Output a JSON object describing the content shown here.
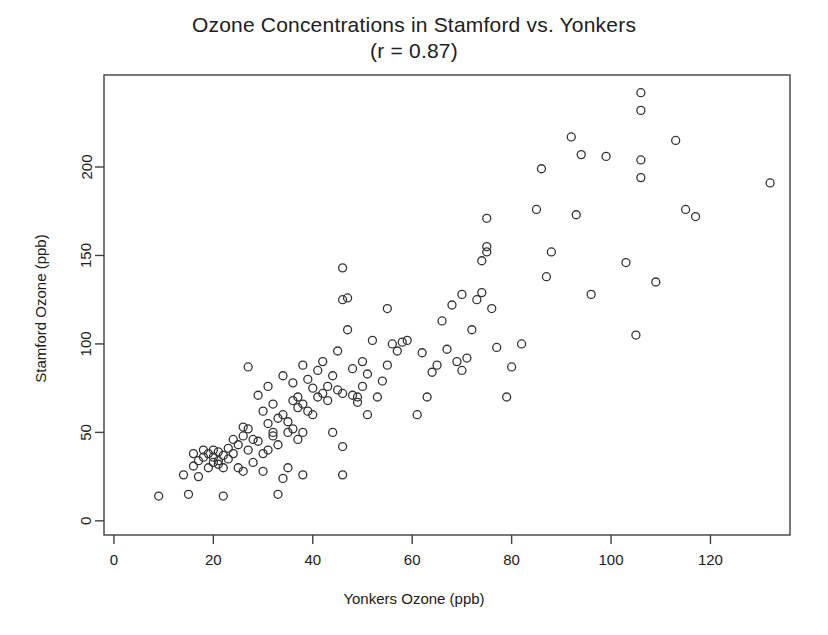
{
  "chart_data": {
    "type": "scatter",
    "title": "Ozone Concentrations in Stamford vs. Yonkers",
    "subtitle": "(r = 0.87)",
    "correlation": 0.87,
    "xlabel": "Yonkers Ozone (ppb)",
    "ylabel": "Stamford Ozone (ppb)",
    "xlim": [
      -2,
      136
    ],
    "ylim": [
      -8,
      252
    ],
    "xticks": [
      0,
      20,
      40,
      60,
      80,
      100,
      120
    ],
    "yticks": [
      0,
      50,
      100,
      150,
      200
    ],
    "xtick_labels": [
      "0",
      "20",
      "40",
      "60",
      "80",
      "100",
      "120"
    ],
    "ytick_labels": [
      "0",
      "50",
      "100",
      "150",
      "200"
    ],
    "grid": false,
    "legend": false,
    "marker": "open-circle",
    "marker_color": "#333333",
    "marker_size": 8,
    "background": "#ffffff",
    "axis_color": "#404040",
    "n_points": 136,
    "series": [
      {
        "name": "Stamford vs Yonkers daily ozone",
        "points": [
          [
            9,
            14
          ],
          [
            14,
            26
          ],
          [
            15,
            15
          ],
          [
            16,
            31
          ],
          [
            16,
            38
          ],
          [
            17,
            34
          ],
          [
            17,
            25
          ],
          [
            18,
            36
          ],
          [
            18,
            40
          ],
          [
            19,
            30
          ],
          [
            19,
            38
          ],
          [
            20,
            33
          ],
          [
            20,
            36
          ],
          [
            20,
            40
          ],
          [
            21,
            32
          ],
          [
            21,
            34
          ],
          [
            21,
            39
          ],
          [
            22,
            14
          ],
          [
            22,
            30
          ],
          [
            22,
            37
          ],
          [
            23,
            35
          ],
          [
            23,
            41
          ],
          [
            24,
            38
          ],
          [
            24,
            46
          ],
          [
            25,
            30
          ],
          [
            25,
            43
          ],
          [
            26,
            28
          ],
          [
            26,
            48
          ],
          [
            26,
            53
          ],
          [
            27,
            40
          ],
          [
            27,
            52
          ],
          [
            27,
            87
          ],
          [
            28,
            33
          ],
          [
            28,
            46
          ],
          [
            29,
            45
          ],
          [
            29,
            71
          ],
          [
            30,
            28
          ],
          [
            30,
            38
          ],
          [
            30,
            62
          ],
          [
            31,
            40
          ],
          [
            31,
            55
          ],
          [
            31,
            76
          ],
          [
            32,
            48
          ],
          [
            32,
            50
          ],
          [
            32,
            66
          ],
          [
            33,
            15
          ],
          [
            33,
            43
          ],
          [
            33,
            58
          ],
          [
            34,
            24
          ],
          [
            34,
            60
          ],
          [
            34,
            82
          ],
          [
            35,
            30
          ],
          [
            35,
            50
          ],
          [
            35,
            56
          ],
          [
            36,
            52
          ],
          [
            36,
            68
          ],
          [
            36,
            78
          ],
          [
            37,
            46
          ],
          [
            37,
            64
          ],
          [
            37,
            70
          ],
          [
            38,
            26
          ],
          [
            38,
            50
          ],
          [
            38,
            66
          ],
          [
            38,
            88
          ],
          [
            39,
            62
          ],
          [
            39,
            80
          ],
          [
            40,
            60
          ],
          [
            40,
            75
          ],
          [
            41,
            70
          ],
          [
            41,
            85
          ],
          [
            42,
            72
          ],
          [
            42,
            90
          ],
          [
            43,
            68
          ],
          [
            43,
            76
          ],
          [
            44,
            50
          ],
          [
            44,
            82
          ],
          [
            45,
            74
          ],
          [
            45,
            96
          ],
          [
            46,
            26
          ],
          [
            46,
            42
          ],
          [
            46,
            72
          ],
          [
            46,
            125
          ],
          [
            46,
            143
          ],
          [
            47,
            108
          ],
          [
            47,
            126
          ],
          [
            48,
            86
          ],
          [
            48,
            71
          ],
          [
            49,
            67
          ],
          [
            49,
            70
          ],
          [
            50,
            76
          ],
          [
            50,
            90
          ],
          [
            51,
            60
          ],
          [
            51,
            83
          ],
          [
            52,
            102
          ],
          [
            53,
            70
          ],
          [
            54,
            79
          ],
          [
            55,
            88
          ],
          [
            55,
            120
          ],
          [
            56,
            100
          ],
          [
            57,
            96
          ],
          [
            58,
            101
          ],
          [
            59,
            102
          ],
          [
            61,
            60
          ],
          [
            62,
            95
          ],
          [
            63,
            70
          ],
          [
            64,
            84
          ],
          [
            65,
            88
          ],
          [
            66,
            113
          ],
          [
            67,
            97
          ],
          [
            68,
            122
          ],
          [
            69,
            90
          ],
          [
            70,
            85
          ],
          [
            70,
            128
          ],
          [
            71,
            92
          ],
          [
            72,
            108
          ],
          [
            73,
            125
          ],
          [
            74,
            129
          ],
          [
            74,
            147
          ],
          [
            75,
            152
          ],
          [
            75,
            155
          ],
          [
            75,
            171
          ],
          [
            76,
            120
          ],
          [
            77,
            98
          ],
          [
            79,
            70
          ],
          [
            80,
            87
          ],
          [
            82,
            100
          ],
          [
            85,
            176
          ],
          [
            86,
            199
          ],
          [
            87,
            138
          ],
          [
            88,
            152
          ],
          [
            92,
            217
          ],
          [
            93,
            173
          ],
          [
            94,
            207
          ],
          [
            96,
            128
          ],
          [
            99,
            206
          ],
          [
            103,
            146
          ],
          [
            105,
            105
          ],
          [
            106,
            194
          ],
          [
            106,
            204
          ],
          [
            106,
            232
          ],
          [
            106,
            242
          ],
          [
            109,
            135
          ],
          [
            113,
            215
          ],
          [
            115,
            176
          ],
          [
            117,
            172
          ],
          [
            132,
            191
          ]
        ]
      }
    ]
  },
  "plot_geometry": {
    "left": 104,
    "right": 790,
    "top": 75,
    "bottom": 535
  }
}
